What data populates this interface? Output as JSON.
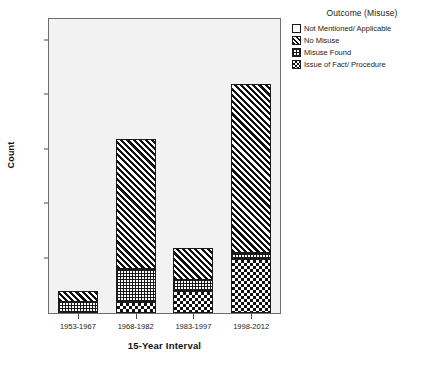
{
  "chart_data": {
    "type": "bar",
    "subtype": "stacked-bar",
    "title": "",
    "xlabel": "15-Year Interval",
    "ylabel": "Count",
    "categories": [
      "1953-1967",
      "1968-1982",
      "1983-1997",
      "1998-2012"
    ],
    "ylim": [
      0,
      27
    ],
    "yticks": [
      5,
      10,
      15,
      20,
      25
    ],
    "grid": false,
    "legend_position": "top-right",
    "legend_title": "Outcome (Misuse)",
    "stack_order_bottom_to_top": [
      "Issue of Fact/ Procedure",
      "Misuse Found",
      "No Misuse",
      "Not Mentioned/ Applicable"
    ],
    "series": [
      {
        "name": "Not Mentioned/ Applicable",
        "pattern": "none",
        "values": [
          0,
          0,
          0,
          0
        ]
      },
      {
        "name": "No Misuse",
        "pattern": "diagonal-hatch",
        "values": [
          1,
          12,
          3,
          15.5
        ]
      },
      {
        "name": "Misuse Found",
        "pattern": "dots",
        "values": [
          1,
          3,
          1,
          0.5
        ]
      },
      {
        "name": "Issue of Fact/ Procedure",
        "pattern": "checkerboard",
        "values": [
          0,
          1,
          2,
          5
        ]
      }
    ],
    "totals": [
      2,
      16,
      6,
      21
    ]
  },
  "axes": {
    "y_title": "Count",
    "x_title": "15-Year Interval",
    "y_tick_labels": [
      "5",
      "10",
      "15",
      "20",
      "25"
    ],
    "x_tick_labels": [
      "1953-1967",
      "1968-1982",
      "1983-1997",
      "1998-2012"
    ]
  },
  "legend": {
    "title": "Outcome (Misuse)",
    "items": [
      {
        "label": "Not Mentioned/ Applicable",
        "pattern": "none"
      },
      {
        "label": "No Misuse",
        "pattern": "diagonal-hatch"
      },
      {
        "label": "Misuse Found",
        "pattern": "dots"
      },
      {
        "label": "Issue of Fact/ Procedure",
        "pattern": "checkerboard"
      }
    ]
  },
  "colors": {
    "plot_background": "#f2f2f2",
    "page_background": "#ffffff",
    "frame": "#6e6e6e",
    "ink": "#101010",
    "text": "#1d1d1d"
  }
}
